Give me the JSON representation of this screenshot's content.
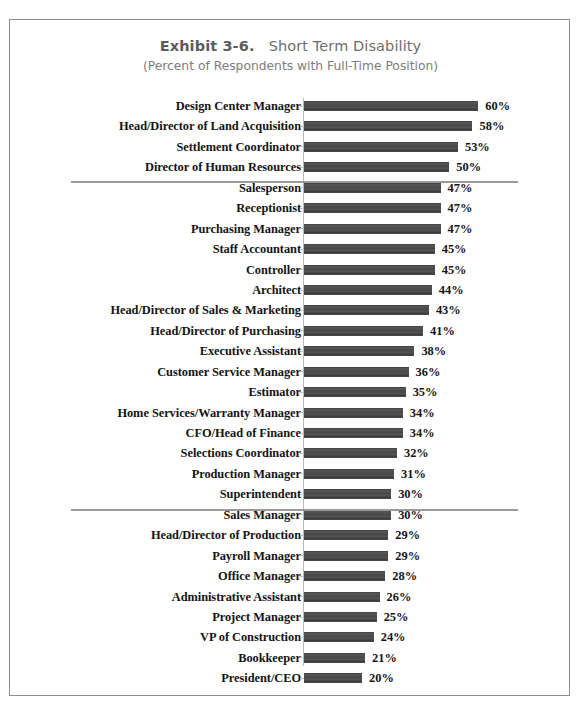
{
  "document": {
    "border_color": "#8e8e8e",
    "background": "#ffffff"
  },
  "header": {
    "exhibit_label": "Exhibit 3-6.",
    "title_text": "Short Term Disability",
    "title_full": "Exhibit 3-6.  Short Term Disability",
    "subtitle": "(Percent of Respondents with Full-Time Position)"
  },
  "chart_data": {
    "type": "bar",
    "orientation": "horizontal",
    "subtitle": "(Percent of Respondents with Full-Time Position)",
    "xlabel": "",
    "ylabel": "",
    "xlim": [
      0,
      60
    ],
    "grid": false,
    "legend": false,
    "value_suffix": "%",
    "bar_color": "#4b4b4b",
    "axis_color": "#b9b9b9",
    "separator_color": "#9a9a9a",
    "separator_after_indices": [
      3,
      19
    ],
    "categories": [
      "Design Center Manager",
      "Head/Director of Land Acquisition",
      "Settlement Coordinator",
      "Director of Human Resources",
      "Salesperson",
      "Receptionist",
      "Purchasing Manager",
      "Staff Accountant",
      "Controller",
      "Architect",
      "Head/Director of Sales & Marketing",
      "Head/Director of Purchasing",
      "Executive Assistant",
      "Customer Service Manager",
      "Estimator",
      "Home Services/Warranty Manager",
      "CFO/Head of Finance",
      "Selections Coordinator",
      "Production Manager",
      "Superintendent",
      "Sales Manager",
      "Head/Director of Production",
      "Payroll Manager",
      "Office Manager",
      "Administrative Assistant",
      "Project Manager",
      "VP of Construction",
      "Bookkeeper",
      "President/CEO"
    ],
    "values": [
      60,
      58,
      53,
      50,
      47,
      47,
      47,
      45,
      45,
      44,
      43,
      41,
      38,
      36,
      35,
      34,
      34,
      32,
      31,
      30,
      30,
      29,
      29,
      28,
      26,
      25,
      24,
      21,
      20
    ],
    "labels": [
      "60%",
      "58%",
      "53%",
      "50%",
      "47%",
      "47%",
      "47%",
      "45%",
      "45%",
      "44%",
      "43%",
      "41%",
      "38%",
      "36%",
      "35%",
      "34%",
      "34%",
      "32%",
      "31%",
      "30%",
      "30%",
      "29%",
      "29%",
      "28%",
      "26%",
      "25%",
      "24%",
      "21%",
      "20%"
    ]
  }
}
